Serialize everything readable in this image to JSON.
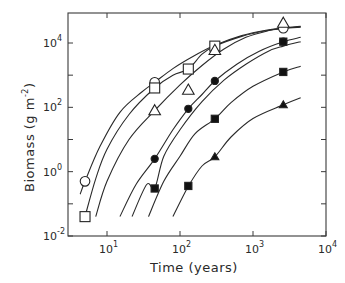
{
  "chart_data": {
    "type": "line",
    "title": "",
    "xlabel": "Time (years)",
    "ylabel": "Biomass (g m-2)",
    "ylabel_parts": {
      "main": "Biomass (g m",
      "sup": "-2",
      "close": ")"
    },
    "xscale": "log",
    "yscale": "log",
    "xlim": [
      3,
      10000
    ],
    "ylim": [
      0.01,
      85000
    ],
    "x_ticks": [
      {
        "value": 10,
        "base": "10",
        "exp": "1"
      },
      {
        "value": 100,
        "base": "10",
        "exp": "2"
      },
      {
        "value": 1000,
        "base": "10",
        "exp": "3"
      },
      {
        "value": 10000,
        "base": "10",
        "exp": "4"
      }
    ],
    "y_ticks": [
      {
        "value": 0.01,
        "base": "10",
        "exp": "-2"
      },
      {
        "value": 1,
        "base": "10",
        "exp": "0"
      },
      {
        "value": 100,
        "base": "10",
        "exp": "2"
      },
      {
        "value": 10000,
        "base": "10",
        "exp": "4"
      }
    ],
    "y_minor_ticks": [
      0.1,
      10,
      1000
    ],
    "grid": false,
    "legend": "none",
    "series": [
      {
        "name": "open-circle",
        "marker": "circle-open",
        "points": [
          [
            5,
            0.5
          ],
          [
            45,
            600
          ],
          [
            2600,
            29000
          ]
        ],
        "curve": [
          [
            4.3,
            0.2
          ],
          [
            5,
            0.5
          ],
          [
            8,
            6
          ],
          [
            15,
            70
          ],
          [
            30,
            300
          ],
          [
            45,
            600
          ],
          [
            80,
            1600
          ],
          [
            150,
            3800
          ],
          [
            300,
            8500
          ],
          [
            700,
            17000
          ],
          [
            1500,
            25000
          ],
          [
            2600,
            29000
          ],
          [
            4500,
            32000
          ]
        ]
      },
      {
        "name": "open-square",
        "marker": "square-open",
        "points": [
          [
            5,
            0.04
          ],
          [
            45,
            400
          ],
          [
            130,
            1550
          ],
          [
            300,
            8000
          ]
        ],
        "curve": [
          [
            5,
            0.04
          ],
          [
            7,
            0.6
          ],
          [
            10,
            5
          ],
          [
            20,
            60
          ],
          [
            45,
            400
          ],
          [
            80,
            1000
          ],
          [
            130,
            1550
          ],
          [
            200,
            4500
          ],
          [
            300,
            8000
          ],
          [
            700,
            16000
          ],
          [
            1500,
            24000
          ],
          [
            2600,
            28500
          ],
          [
            4500,
            31000
          ]
        ]
      },
      {
        "name": "open-triangle",
        "marker": "triangle-open",
        "points": [
          [
            45,
            80
          ],
          [
            130,
            350
          ],
          [
            300,
            6000
          ],
          [
            2600,
            42000
          ]
        ],
        "curve": [
          [
            7,
            0.04
          ],
          [
            10,
            0.5
          ],
          [
            20,
            10
          ],
          [
            45,
            80
          ],
          [
            100,
            500
          ],
          [
            200,
            2000
          ],
          [
            400,
            6500
          ],
          [
            800,
            15000
          ],
          [
            1600,
            24000
          ],
          [
            2600,
            29000
          ],
          [
            4500,
            33000
          ]
        ]
      },
      {
        "name": "filled-circle",
        "marker": "circle-filled",
        "points": [
          [
            45,
            2.5
          ],
          [
            130,
            90
          ],
          [
            300,
            660
          ],
          [
            2600,
            11000
          ]
        ],
        "curve": [
          [
            15,
            0.04
          ],
          [
            25,
            0.4
          ],
          [
            45,
            2.5
          ],
          [
            80,
            20
          ],
          [
            130,
            90
          ],
          [
            200,
            250
          ],
          [
            300,
            660
          ],
          [
            600,
            2200
          ],
          [
            1200,
            5500
          ],
          [
            2600,
            11000
          ],
          [
            4500,
            15000
          ]
        ]
      },
      {
        "name": "filled-square-upper",
        "marker": "square-filled",
        "points": [
          [
            130,
            0.36
          ],
          [
            300,
            44
          ],
          [
            2600,
            1260
          ]
        ],
        "curve": [
          [
            37,
            0.04
          ],
          [
            60,
            0.5
          ],
          [
            100,
            3
          ],
          [
            160,
            15
          ],
          [
            300,
            44
          ],
          [
            500,
            140
          ],
          [
            1000,
            450
          ],
          [
            2600,
            1260
          ],
          [
            4500,
            1900
          ]
        ]
      },
      {
        "name": "filled-square-lower",
        "marker": "square-filled",
        "points": [
          [
            45,
            0.3
          ],
          [
            2600,
            11000
          ]
        ],
        "curve": [
          [
            22,
            0.04
          ],
          [
            35,
            0.4
          ],
          [
            45,
            0.3
          ],
          [
            60,
            3
          ],
          [
            100,
            20
          ],
          [
            200,
            150
          ],
          [
            400,
            700
          ],
          [
            800,
            2200
          ],
          [
            1600,
            5500
          ],
          [
            2600,
            8000
          ],
          [
            4500,
            11000
          ]
        ]
      },
      {
        "name": "filled-triangle",
        "marker": "triangle-filled",
        "points": [
          [
            300,
            2.9
          ],
          [
            2600,
            120
          ]
        ],
        "curve": [
          [
            80,
            0.04
          ],
          [
            130,
            0.35
          ],
          [
            200,
            1.5
          ],
          [
            300,
            2.9
          ],
          [
            500,
            12
          ],
          [
            1000,
            45
          ],
          [
            2600,
            120
          ],
          [
            4500,
            200
          ]
        ]
      }
    ]
  }
}
